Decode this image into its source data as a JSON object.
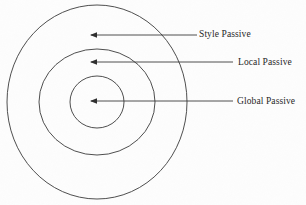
{
  "figure": {
    "type": "concentric-circle-diagram",
    "background_color": "#fdfdfd",
    "stroke_color": "#3a3a3a",
    "text_color": "#1f1f1f",
    "center": {
      "x": 97,
      "y": 102
    },
    "rings": [
      {
        "name": "outer-ring",
        "label_ref": "style-passive",
        "rx": 90,
        "ry": 97
      },
      {
        "name": "middle-ring",
        "label_ref": "local-passive",
        "rx": 58,
        "ry": 53
      },
      {
        "name": "inner-ring",
        "label_ref": "global-passive",
        "rx": 27,
        "ry": 26
      }
    ],
    "labels": [
      {
        "id": "style-passive",
        "text": "Style Passive",
        "text_x": 199,
        "text_y": 29,
        "arrow_tip_x": 90,
        "arrow_tip_y": 35,
        "arrow_tail_x": 197
      },
      {
        "id": "local-passive",
        "text": "Local Passive",
        "text_x": 238,
        "text_y": 57,
        "arrow_tip_x": 90,
        "arrow_tip_y": 62,
        "arrow_tail_x": 233
      },
      {
        "id": "global-passive",
        "text": "Global Passive",
        "text_x": 237,
        "text_y": 96,
        "arrow_tip_x": 90,
        "arrow_tip_y": 101,
        "arrow_tail_x": 233
      }
    ]
  }
}
